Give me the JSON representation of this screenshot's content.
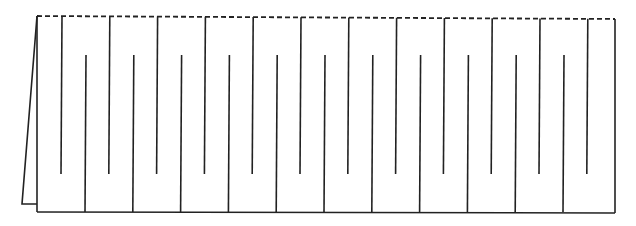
{
  "diagram": {
    "top_edge_style": "dashed",
    "hanging_fingers_count": 12,
    "rising_fingers_count": 11,
    "has_left_flap": true
  }
}
